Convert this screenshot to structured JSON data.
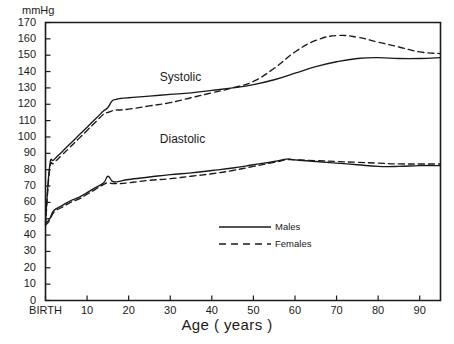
{
  "chart_data": {
    "type": "line",
    "title": "",
    "xlabel": "Age ( years )",
    "ylabel": "mmHg",
    "ylim": [
      0,
      170
    ],
    "xlim": [
      0,
      95
    ],
    "grid": false,
    "legend_position": "inside-center-right",
    "y_ticks": [
      0,
      10,
      20,
      30,
      40,
      50,
      60,
      70,
      80,
      90,
      100,
      110,
      120,
      130,
      140,
      150,
      160,
      170
    ],
    "x_ticks": [
      0,
      10,
      20,
      30,
      40,
      50,
      60,
      70,
      80,
      90
    ],
    "x_tick_labels": [
      "BIRTH",
      "10",
      "20",
      "30",
      "40",
      "50",
      "60",
      "70",
      "80",
      "90"
    ],
    "annotations": [
      {
        "text": "Systolic",
        "x": 15,
        "y": 136
      },
      {
        "text": "Diastolic",
        "x": 15,
        "y": 98
      }
    ],
    "legend": [
      {
        "name": "Males",
        "style": "solid"
      },
      {
        "name": "Females",
        "style": "dashed"
      }
    ],
    "series": [
      {
        "name": "Systolic Males",
        "measure": "Systolic",
        "sex": "Males",
        "style": "solid",
        "x": [
          0,
          1,
          2,
          4,
          6,
          8,
          10,
          12,
          14,
          15,
          16,
          17,
          18,
          20,
          25,
          30,
          35,
          40,
          45,
          50,
          55,
          60,
          65,
          70,
          75,
          80,
          85,
          90,
          95
        ],
        "y": [
          48,
          82,
          86,
          91,
          96,
          101,
          106,
          111,
          116,
          118,
          122,
          123,
          123.5,
          124,
          125,
          126,
          127,
          128.5,
          130,
          132,
          135,
          139,
          143,
          146,
          148,
          148.5,
          148,
          148,
          148.5
        ]
      },
      {
        "name": "Systolic Females",
        "measure": "Systolic",
        "sex": "Females",
        "style": "dashed",
        "x": [
          0,
          1,
          2,
          4,
          6,
          8,
          10,
          12,
          14,
          15,
          16,
          17,
          18,
          20,
          25,
          30,
          35,
          40,
          45,
          50,
          55,
          60,
          65,
          70,
          75,
          80,
          85,
          90,
          95
        ],
        "y": [
          46,
          80,
          84,
          89,
          94,
          99,
          104,
          109,
          114,
          115,
          116,
          116.5,
          116.5,
          117,
          119,
          121,
          124,
          127,
          130,
          134,
          142,
          152,
          159,
          162,
          161,
          158,
          155,
          152,
          151
        ]
      },
      {
        "name": "Diastolic Males",
        "measure": "Diastolic",
        "sex": "Males",
        "style": "solid",
        "x": [
          0,
          1,
          2,
          4,
          6,
          8,
          10,
          12,
          14,
          15,
          16,
          17,
          18,
          20,
          25,
          30,
          35,
          40,
          45,
          50,
          55,
          58,
          60,
          65,
          70,
          75,
          80,
          85,
          90,
          95
        ],
        "y": [
          47,
          50,
          55,
          58,
          61,
          63,
          66,
          69,
          72,
          76,
          73,
          72.5,
          73,
          74,
          75.5,
          77,
          78,
          79.5,
          81,
          83,
          85,
          86.5,
          86,
          85,
          84,
          83,
          82,
          82,
          82.5,
          82.5
        ]
      },
      {
        "name": "Diastolic Females",
        "measure": "Diastolic",
        "sex": "Females",
        "style": "dashed",
        "x": [
          0,
          1,
          2,
          4,
          6,
          8,
          10,
          12,
          14,
          15,
          16,
          17,
          18,
          20,
          25,
          30,
          35,
          40,
          45,
          50,
          55,
          58,
          60,
          65,
          70,
          75,
          80,
          85,
          90,
          95
        ],
        "y": [
          46,
          49,
          54,
          57,
          60,
          62,
          65,
          68,
          71,
          72,
          71.5,
          71.5,
          71.5,
          72,
          73.5,
          74.5,
          76,
          77.5,
          79.5,
          82,
          84.5,
          86,
          86,
          85.5,
          85,
          84.5,
          84,
          83.5,
          83.5,
          83.5
        ]
      }
    ]
  },
  "colors": {
    "line": "#1a1a1a",
    "axis": "#1a1a1a",
    "background": "#ffffff"
  }
}
